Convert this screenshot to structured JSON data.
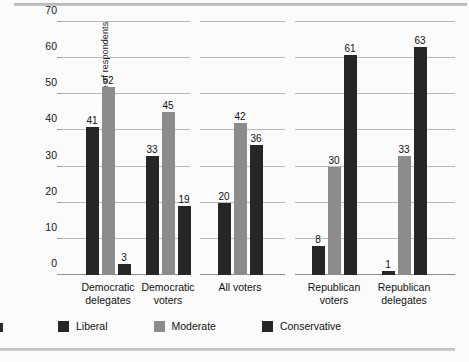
{
  "chart_data": {
    "type": "bar",
    "title": "",
    "xlabel": "",
    "ylabel": "Percentage of respondents",
    "ylim": [
      0,
      70
    ],
    "yticks": [
      0,
      10,
      20,
      30,
      40,
      50,
      60,
      70
    ],
    "grid": true,
    "legend_position": "bottom",
    "categories": [
      "Democratic delegates",
      "Democratic voters",
      "All voters",
      "Republican voters",
      "Republican delegates"
    ],
    "category_lines": [
      [
        "Democratic",
        "delegates"
      ],
      [
        "Democratic",
        "voters"
      ],
      [
        "All voters"
      ],
      [
        "Republican",
        "voters"
      ],
      [
        "Republican",
        "delegates"
      ]
    ],
    "series": [
      {
        "name": "Liberal",
        "color": "#262626",
        "values": [
          41,
          33,
          20,
          8,
          1
        ]
      },
      {
        "name": "Moderate",
        "color": "#8c8c8c",
        "values": [
          52,
          45,
          42,
          30,
          33
        ]
      },
      {
        "name": "Conservative",
        "color": "#262626",
        "values": [
          3,
          19,
          36,
          61,
          63
        ]
      }
    ]
  },
  "axis": {
    "y_label": "Percentage of respondents",
    "y_ticks": [
      "0",
      "10",
      "20",
      "30",
      "40",
      "50",
      "60",
      "70"
    ]
  },
  "legend": {
    "items": [
      {
        "label": "Liberal"
      },
      {
        "label": "Moderate"
      },
      {
        "label": "Conservative"
      }
    ]
  },
  "groups": [
    {
      "line1": "Democratic",
      "line2": "delegates",
      "bars": [
        {
          "series": "Liberal",
          "value": 41,
          "label": "41"
        },
        {
          "series": "Moderate",
          "value": 52,
          "label": "52"
        },
        {
          "series": "Conservative",
          "value": 3,
          "label": "3"
        }
      ]
    },
    {
      "line1": "Democratic",
      "line2": "voters",
      "bars": [
        {
          "series": "Liberal",
          "value": 33,
          "label": "33"
        },
        {
          "series": "Moderate",
          "value": 45,
          "label": "45"
        },
        {
          "series": "Conservative",
          "value": 19,
          "label": "19"
        }
      ]
    },
    {
      "line1": "All voters",
      "line2": "",
      "bars": [
        {
          "series": "Liberal",
          "value": 20,
          "label": "20"
        },
        {
          "series": "Moderate",
          "value": 42,
          "label": "42"
        },
        {
          "series": "Conservative",
          "value": 36,
          "label": "36"
        }
      ]
    },
    {
      "line1": "Republican",
      "line2": "voters",
      "bars": [
        {
          "series": "Liberal",
          "value": 8,
          "label": "8"
        },
        {
          "series": "Moderate",
          "value": 30,
          "label": "30"
        },
        {
          "series": "Conservative",
          "value": 61,
          "label": "61"
        }
      ]
    },
    {
      "line1": "Republican",
      "line2": "delegates",
      "bars": [
        {
          "series": "Liberal",
          "value": 1,
          "label": "1"
        },
        {
          "series": "Moderate",
          "value": 33,
          "label": "33"
        },
        {
          "series": "Conservative",
          "value": 63,
          "label": "63"
        }
      ]
    }
  ]
}
